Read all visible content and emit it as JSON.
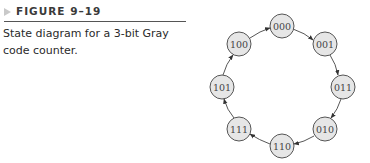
{
  "figure": {
    "label": "FIGURE 9–19",
    "caption": "State diagram for a 3-bit Gray code counter."
  },
  "diagram": {
    "type": "state-diagram",
    "states": [
      "000",
      "001",
      "011",
      "010",
      "110",
      "111",
      "101",
      "100"
    ],
    "transitions": [
      {
        "from": "000",
        "to": "001"
      },
      {
        "from": "001",
        "to": "011"
      },
      {
        "from": "011",
        "to": "010"
      },
      {
        "from": "010",
        "to": "110"
      },
      {
        "from": "110",
        "to": "111"
      },
      {
        "from": "111",
        "to": "101"
      },
      {
        "from": "101",
        "to": "100"
      },
      {
        "from": "100",
        "to": "000"
      }
    ],
    "node_fill": "#e6e6e6",
    "node_stroke": "#555555"
  }
}
